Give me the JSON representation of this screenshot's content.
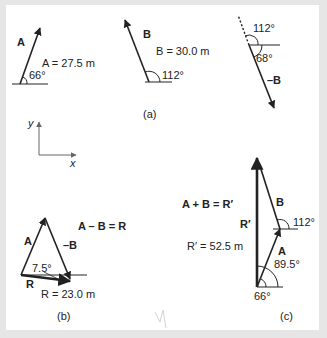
{
  "panel_a": {
    "caption": "(a)",
    "vector_A": {
      "label": "A",
      "magnitude_text": "A = 27.5  m",
      "angle_text": "66°"
    },
    "vector_B": {
      "label": "B",
      "magnitude_text": "B = 30.0  m",
      "angle_text": "112°"
    },
    "vector_negB": {
      "label": "–B",
      "angle_top_text": "112°",
      "angle_bottom_text": "68°"
    }
  },
  "axes": {
    "x_label": "x",
    "y_label": "y"
  },
  "panel_b": {
    "caption": "(b)",
    "equation": "A – B = R",
    "label_A": "A",
    "label_negB": "–B",
    "label_R": "R",
    "angle_text": "7.5°",
    "magnitude_text": "R = 23.0  m"
  },
  "panel_c": {
    "caption": "(c)",
    "equation": "A + B = R′",
    "label_Rprime": "R′",
    "magnitude_text": "R′ = 52.5  m",
    "label_A": "A",
    "label_B": "B",
    "angle_B_text": "112°",
    "angle_R_text": "89.5°",
    "angle_A_text": "66°"
  },
  "colors": {
    "background": "#e6e6e6",
    "panel": "#ffffff",
    "ink": "#222222",
    "axis": "#666666"
  }
}
